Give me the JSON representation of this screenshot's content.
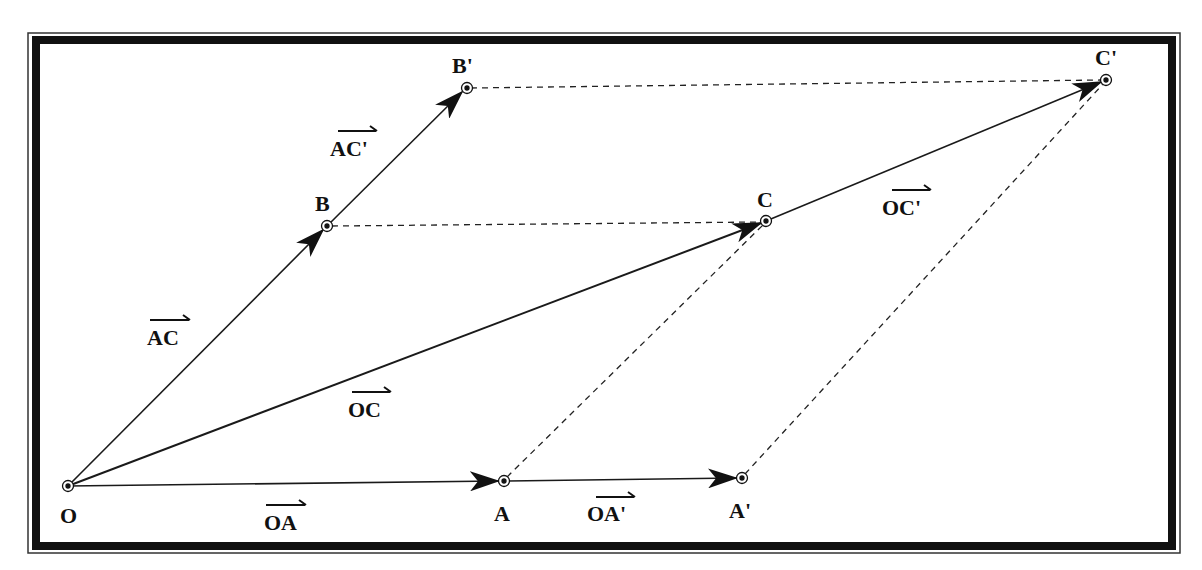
{
  "diagram": {
    "type": "vector-parallelogram-construction",
    "colors": {
      "line": "#1a1a1a",
      "background": "#ffffff",
      "frame": "#111111"
    },
    "points": {
      "O": {
        "label": "O",
        "x": 68,
        "y": 486
      },
      "A": {
        "label": "A",
        "x": 503,
        "y": 481
      },
      "A_prime": {
        "label": "A'",
        "x": 741,
        "y": 478
      },
      "B": {
        "label": "B",
        "x": 327,
        "y": 226
      },
      "B_prime": {
        "label": "B'",
        "x": 466,
        "y": 88
      },
      "C": {
        "label": "C",
        "x": 766,
        "y": 221
      },
      "C_prime": {
        "label": "C'",
        "x": 1106,
        "y": 80
      }
    },
    "vectors": {
      "OA": {
        "label": "OA"
      },
      "OA_prime": {
        "label": "OA'"
      },
      "AC": {
        "label": "AC"
      },
      "AC_prime": {
        "label": "AC'"
      },
      "OC": {
        "label": "OC"
      },
      "OC_prime": {
        "label": "OC'"
      }
    }
  }
}
